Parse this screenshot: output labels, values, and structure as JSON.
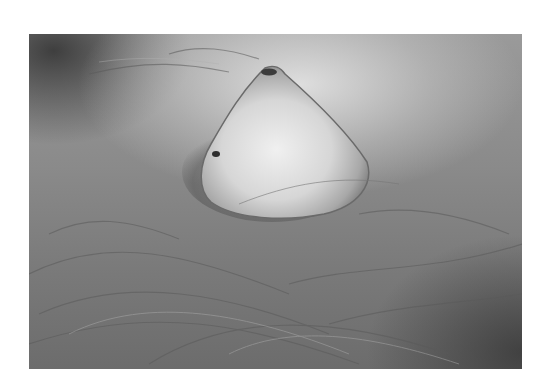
{
  "image": {
    "type": "grayscale clinical photograph",
    "subject": "raised cone-shaped skin lesion with surrounding hair",
    "colors": {
      "background": "#ffffff",
      "skin_mid": "#8a8a8a",
      "lesion_highlight": "#e8e8e8",
      "shadow": "#3a3a3a"
    }
  }
}
